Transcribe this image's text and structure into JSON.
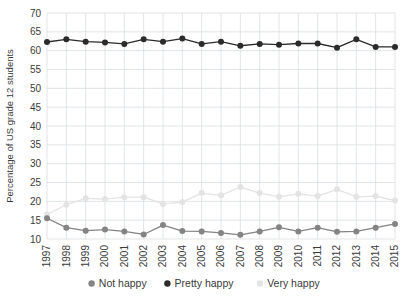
{
  "chart_data": {
    "type": "line",
    "title": "",
    "subtitle": "",
    "xlabel": "",
    "ylabel": "Percentage of US grade 12 students",
    "x": [
      1997,
      1998,
      1999,
      2000,
      2001,
      2002,
      2003,
      2004,
      2005,
      2006,
      2007,
      2008,
      2009,
      2010,
      2011,
      2012,
      2013,
      2014,
      2015
    ],
    "categories": [
      "1997",
      "1998",
      "1999",
      "2000",
      "2001",
      "2002",
      "2003",
      "2004",
      "2005",
      "2006",
      "2007",
      "2008",
      "2009",
      "2010",
      "2011",
      "2012",
      "2013",
      "2014",
      "2015"
    ],
    "xlim": [
      1997,
      2015
    ],
    "ylim": [
      10,
      70
    ],
    "yticks": [
      10,
      15,
      20,
      25,
      30,
      35,
      40,
      45,
      50,
      55,
      60,
      65,
      70
    ],
    "ytick_labels": [
      "10",
      "15",
      "20",
      "25",
      "30",
      "35",
      "40",
      "45",
      "50",
      "55",
      "60",
      "65",
      "70"
    ],
    "grid": true,
    "grid_color": "#d9dde2",
    "legend_position": "bottom",
    "series": [
      {
        "name": "Not happy",
        "color": "#848484",
        "values": [
          15.5,
          13.0,
          12.2,
          12.5,
          12.0,
          11.2,
          13.7,
          12.1,
          12.0,
          11.6,
          11.1,
          12.0,
          13.1,
          12.0,
          13.0,
          11.9,
          12.0,
          13.0,
          14.0
        ]
      },
      {
        "name": "Pretty happy",
        "color": "#2b2b2b",
        "values": [
          62.3,
          63.0,
          62.4,
          62.2,
          61.8,
          63.0,
          62.4,
          63.2,
          61.8,
          62.4,
          61.3,
          61.8,
          61.6,
          61.9,
          61.9,
          60.8,
          63.0,
          61.0,
          61.0
        ]
      },
      {
        "name": "Very happy",
        "color": "#e3e3e3",
        "values": [
          16.5,
          19.1,
          20.8,
          20.6,
          21.1,
          21.1,
          19.3,
          19.8,
          22.2,
          21.6,
          23.8,
          22.2,
          21.2,
          22.0,
          21.4,
          23.2,
          21.2,
          21.4,
          20.2
        ]
      }
    ],
    "legend": [
      {
        "label": "Not happy",
        "color": "#848484"
      },
      {
        "label": "Pretty happy",
        "color": "#2b2b2b"
      },
      {
        "label": "Very happy",
        "color": "#e3e3e3"
      }
    ]
  }
}
